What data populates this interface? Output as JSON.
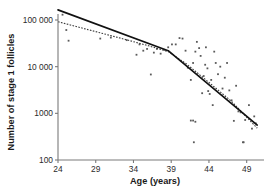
{
  "chart_data": {
    "type": "scatter",
    "title": "",
    "subtitle": "",
    "xlabel": "Age (years)",
    "ylabel": "Number of stage 1 follicles",
    "xlim": [
      24,
      50.5
    ],
    "ylim": [
      100,
      200000
    ],
    "yscale": "log",
    "xscale": "linear",
    "grid": false,
    "legend": null,
    "xticks": [
      24,
      29,
      34,
      39,
      44,
      49
    ],
    "xticklabels": [
      "24",
      "29",
      "34",
      "39",
      "44",
      "49"
    ],
    "yticks": [
      100,
      1000,
      10000,
      100000
    ],
    "yticklabels": [
      "100",
      "1000",
      "10 000",
      "100 000"
    ],
    "series": [
      {
        "name": "Observed follicle counts",
        "marker": "point",
        "points": [
          [
            24.6,
            130000
          ],
          [
            25.1,
            61000
          ],
          [
            25.4,
            36000
          ],
          [
            29.6,
            40000
          ],
          [
            31.0,
            42000
          ],
          [
            33.1,
            37000
          ],
          [
            34.4,
            18000
          ],
          [
            34.8,
            30000
          ],
          [
            35.3,
            22000
          ],
          [
            35.8,
            24000
          ],
          [
            36.3,
            6800
          ],
          [
            36.7,
            20000
          ],
          [
            37.1,
            24000
          ],
          [
            37.6,
            19000
          ],
          [
            38.1,
            23000
          ],
          [
            38.6,
            26000
          ],
          [
            39.1,
            30000
          ],
          [
            39.6,
            30000
          ],
          [
            40.1,
            41000
          ],
          [
            40.5,
            40000
          ],
          [
            40.9,
            22000
          ],
          [
            41.2,
            9500
          ],
          [
            41.6,
            5200
          ],
          [
            41.9,
            12000
          ],
          [
            42.2,
            21000
          ],
          [
            42.4,
            34000
          ],
          [
            42.7,
            25000
          ],
          [
            42.9,
            17000
          ],
          [
            43.1,
            2700
          ],
          [
            43.3,
            6300
          ],
          [
            43.5,
            11000
          ],
          [
            43.6,
            26000
          ],
          [
            43.8,
            9200
          ],
          [
            43.9,
            3000
          ],
          [
            44.1,
            2600
          ],
          [
            44.3,
            5200
          ],
          [
            44.5,
            1500
          ],
          [
            44.7,
            21000
          ],
          [
            44.9,
            12000
          ],
          [
            45.2,
            6900
          ],
          [
            45.5,
            10000
          ],
          [
            45.8,
            3400
          ],
          [
            46.1,
            5800
          ],
          [
            46.4,
            12000
          ],
          [
            46.7,
            3100
          ],
          [
            47.0,
            1900
          ],
          [
            47.3,
            690
          ],
          [
            47.6,
            3900
          ],
          [
            47.9,
            1100
          ],
          [
            48.2,
            1050
          ],
          [
            48.5,
            240
          ],
          [
            48.6,
            240
          ],
          [
            48.8,
            720
          ],
          [
            49.3,
            1500
          ],
          [
            49.7,
            470
          ],
          [
            50.0,
            860
          ],
          [
            50.2,
            610
          ],
          [
            42.2,
            660
          ],
          [
            42.0,
            240
          ],
          [
            41.9,
            700
          ],
          [
            41.6,
            700
          ]
        ]
      },
      {
        "name": "Segmented regression (solid)",
        "style": "solid",
        "points": [
          [
            24.0,
            165000
          ],
          [
            38.6,
            22000
          ],
          [
            50.4,
            560
          ]
        ]
      },
      {
        "name": "Fitted model (dotted)",
        "style": "dotted",
        "points": [
          [
            24.0,
            92000
          ],
          [
            28.0,
            62000
          ],
          [
            32.0,
            42000
          ],
          [
            36.0,
            28000
          ],
          [
            38.6,
            21000
          ],
          [
            41.0,
            11500
          ],
          [
            44.0,
            4600
          ],
          [
            47.0,
            1800
          ],
          [
            50.4,
            480
          ]
        ]
      }
    ]
  }
}
